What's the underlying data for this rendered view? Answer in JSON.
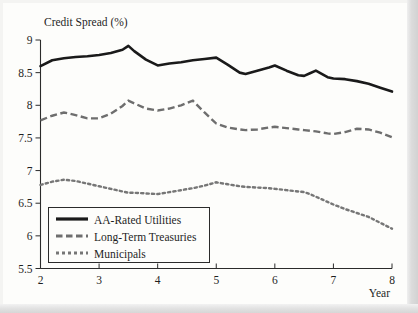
{
  "chart_data": {
    "type": "line",
    "title": "Credit Spread (%)",
    "xlabel": "Year",
    "ylabel": "Credit Spread (%)",
    "xlim": [
      2,
      8
    ],
    "ylim": [
      5.5,
      9
    ],
    "xticks": [
      "2",
      "3",
      "4",
      "5",
      "6",
      "7",
      "8"
    ],
    "yticks": [
      "9",
      "8.5",
      "8",
      "7.5",
      "7",
      "6.5",
      "6",
      "5.5"
    ],
    "grid": false,
    "legend_position": "lower-left",
    "x": [
      2.0,
      2.2,
      2.4,
      2.6,
      2.8,
      3.0,
      3.2,
      3.4,
      3.5,
      3.6,
      3.8,
      4.0,
      4.2,
      4.4,
      4.6,
      4.8,
      5.0,
      5.2,
      5.4,
      5.5,
      5.7,
      5.9,
      6.0,
      6.2,
      6.4,
      6.5,
      6.6,
      6.7,
      6.9,
      7.0,
      7.2,
      7.4,
      7.6,
      7.8,
      8.0
    ],
    "series": [
      {
        "name": "AA-Rated Utilities",
        "style": "solid",
        "color": "#1a1a1a",
        "values": [
          8.6,
          8.69,
          8.72,
          8.74,
          8.75,
          8.77,
          8.8,
          8.85,
          8.91,
          8.83,
          8.7,
          8.61,
          8.64,
          8.66,
          8.69,
          8.71,
          8.73,
          8.62,
          8.5,
          8.48,
          8.53,
          8.58,
          8.61,
          8.53,
          8.46,
          8.45,
          8.49,
          8.53,
          8.43,
          8.41,
          8.4,
          8.37,
          8.33,
          8.27,
          8.21
        ]
      },
      {
        "name": "Long-Term Treasuries",
        "style": "dashed",
        "color": "#6e6e6e",
        "values": [
          7.77,
          7.84,
          7.89,
          7.85,
          7.8,
          7.8,
          7.87,
          7.99,
          8.07,
          8.03,
          7.95,
          7.92,
          7.95,
          8.0,
          8.07,
          7.89,
          7.72,
          7.66,
          7.63,
          7.62,
          7.63,
          7.66,
          7.67,
          7.65,
          7.63,
          7.62,
          7.61,
          7.6,
          7.57,
          7.56,
          7.59,
          7.64,
          7.63,
          7.58,
          7.51
        ]
      },
      {
        "name": "Municipals",
        "style": "dotted",
        "color": "#767676",
        "values": [
          6.78,
          6.83,
          6.86,
          6.84,
          6.8,
          6.76,
          6.72,
          6.68,
          6.66,
          6.66,
          6.65,
          6.64,
          6.67,
          6.7,
          6.73,
          6.77,
          6.82,
          6.79,
          6.76,
          6.75,
          6.74,
          6.73,
          6.72,
          6.7,
          6.68,
          6.67,
          6.64,
          6.6,
          6.52,
          6.48,
          6.41,
          6.35,
          6.29,
          6.2,
          6.11
        ]
      }
    ]
  },
  "legend": {
    "items": [
      {
        "label": "AA-Rated Utilities",
        "style": "solid"
      },
      {
        "label": "Long-Term Treasuries",
        "style": "dashed"
      },
      {
        "label": "Municipals",
        "style": "dotted"
      }
    ]
  }
}
